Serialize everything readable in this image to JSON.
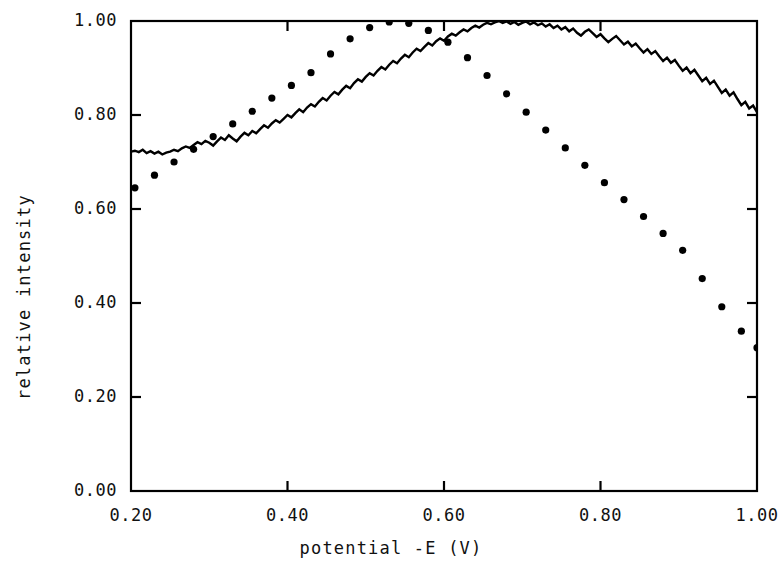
{
  "chart_data": {
    "type": "line",
    "title": "",
    "xlabel": "potential -E (V)",
    "ylabel": "relative intensity",
    "xlim": [
      0.2,
      1.0
    ],
    "ylim": [
      0.0,
      1.0
    ],
    "xticks": [
      "0.20",
      "0.40",
      "0.60",
      "0.80",
      "1.00"
    ],
    "yticks": [
      "0.00",
      "0.20",
      "0.40",
      "0.60",
      "0.80",
      "1.00"
    ],
    "xtick_values": [
      0.2,
      0.4,
      0.6,
      0.8,
      1.0
    ],
    "ytick_values": [
      0.0,
      0.2,
      0.4,
      0.6,
      0.8,
      1.0
    ],
    "grid": false,
    "legend": "none",
    "frame": "box",
    "tick_direction": "in",
    "series": [
      {
        "name": "measured",
        "style": "solid-noisy",
        "color": "#000000",
        "x": [
          0.2,
          0.205,
          0.21,
          0.215,
          0.22,
          0.225,
          0.23,
          0.235,
          0.24,
          0.245,
          0.25,
          0.255,
          0.26,
          0.265,
          0.27,
          0.275,
          0.28,
          0.285,
          0.29,
          0.295,
          0.3,
          0.305,
          0.31,
          0.315,
          0.32,
          0.325,
          0.33,
          0.335,
          0.34,
          0.345,
          0.35,
          0.355,
          0.36,
          0.365,
          0.37,
          0.375,
          0.38,
          0.385,
          0.39,
          0.395,
          0.4,
          0.405,
          0.41,
          0.415,
          0.42,
          0.425,
          0.43,
          0.435,
          0.44,
          0.445,
          0.45,
          0.455,
          0.46,
          0.465,
          0.47,
          0.475,
          0.48,
          0.485,
          0.49,
          0.495,
          0.5,
          0.505,
          0.51,
          0.515,
          0.52,
          0.525,
          0.53,
          0.535,
          0.54,
          0.545,
          0.55,
          0.555,
          0.56,
          0.565,
          0.57,
          0.575,
          0.58,
          0.585,
          0.59,
          0.595,
          0.6,
          0.605,
          0.61,
          0.615,
          0.62,
          0.625,
          0.63,
          0.635,
          0.64,
          0.645,
          0.65,
          0.655,
          0.66,
          0.665,
          0.67,
          0.675,
          0.68,
          0.685,
          0.69,
          0.695,
          0.7,
          0.705,
          0.71,
          0.715,
          0.72,
          0.725,
          0.73,
          0.735,
          0.74,
          0.745,
          0.75,
          0.755,
          0.76,
          0.765,
          0.77,
          0.775,
          0.78,
          0.785,
          0.79,
          0.795,
          0.8,
          0.805,
          0.81,
          0.815,
          0.82,
          0.825,
          0.83,
          0.835,
          0.84,
          0.845,
          0.85,
          0.855,
          0.86,
          0.865,
          0.87,
          0.875,
          0.88,
          0.885,
          0.89,
          0.895,
          0.9,
          0.905,
          0.91,
          0.915,
          0.92,
          0.925,
          0.93,
          0.935,
          0.94,
          0.945,
          0.95,
          0.955,
          0.96,
          0.965,
          0.97,
          0.975,
          0.98,
          0.985,
          0.99,
          0.995,
          1.0
        ],
        "y": [
          0.722,
          0.724,
          0.721,
          0.726,
          0.719,
          0.723,
          0.718,
          0.722,
          0.716,
          0.72,
          0.722,
          0.726,
          0.723,
          0.729,
          0.733,
          0.73,
          0.736,
          0.742,
          0.738,
          0.745,
          0.741,
          0.735,
          0.744,
          0.752,
          0.747,
          0.757,
          0.75,
          0.744,
          0.754,
          0.762,
          0.757,
          0.766,
          0.761,
          0.77,
          0.778,
          0.773,
          0.782,
          0.789,
          0.784,
          0.792,
          0.8,
          0.795,
          0.804,
          0.812,
          0.806,
          0.816,
          0.823,
          0.818,
          0.828,
          0.836,
          0.831,
          0.841,
          0.849,
          0.844,
          0.854,
          0.862,
          0.857,
          0.868,
          0.876,
          0.871,
          0.881,
          0.889,
          0.884,
          0.894,
          0.902,
          0.897,
          0.907,
          0.915,
          0.91,
          0.92,
          0.928,
          0.923,
          0.933,
          0.941,
          0.936,
          0.945,
          0.953,
          0.948,
          0.957,
          0.963,
          0.958,
          0.967,
          0.973,
          0.969,
          0.976,
          0.982,
          0.978,
          0.985,
          0.99,
          0.986,
          0.992,
          0.996,
          0.993,
          0.997,
          1.0,
          0.996,
          0.999,
          0.994,
          0.998,
          0.992,
          0.996,
          0.999,
          0.993,
          0.997,
          0.991,
          0.995,
          0.988,
          0.993,
          0.985,
          0.99,
          0.982,
          0.987,
          0.978,
          0.984,
          0.975,
          0.969,
          0.977,
          0.982,
          0.974,
          0.966,
          0.972,
          0.963,
          0.955,
          0.962,
          0.968,
          0.959,
          0.95,
          0.956,
          0.946,
          0.952,
          0.942,
          0.933,
          0.94,
          0.93,
          0.936,
          0.925,
          0.915,
          0.922,
          0.911,
          0.917,
          0.905,
          0.894,
          0.901,
          0.889,
          0.896,
          0.884,
          0.872,
          0.879,
          0.866,
          0.873,
          0.86,
          0.847,
          0.854,
          0.841,
          0.848,
          0.834,
          0.821,
          0.828,
          0.814,
          0.82,
          0.806
        ]
      },
      {
        "name": "calculated",
        "style": "dotted",
        "color": "#000000",
        "x": [
          0.205,
          0.23,
          0.255,
          0.28,
          0.305,
          0.33,
          0.355,
          0.38,
          0.405,
          0.43,
          0.455,
          0.48,
          0.505,
          0.53,
          0.555,
          0.58,
          0.605,
          0.63,
          0.655,
          0.68,
          0.705,
          0.73,
          0.755,
          0.78,
          0.805,
          0.83,
          0.855,
          0.88,
          0.905,
          0.93,
          0.955,
          0.98,
          1.0
        ],
        "y": [
          0.645,
          0.672,
          0.7,
          0.727,
          0.754,
          0.781,
          0.808,
          0.836,
          0.863,
          0.89,
          0.93,
          0.962,
          0.986,
          0.998,
          0.995,
          0.98,
          0.955,
          0.922,
          0.884,
          0.845,
          0.806,
          0.768,
          0.73,
          0.693,
          0.656,
          0.62,
          0.584,
          0.548,
          0.512,
          0.452,
          0.392,
          0.34,
          0.305
        ]
      }
    ],
    "annotations": []
  },
  "axes": {
    "left_px": 131,
    "right_px": 757,
    "top_px": 21,
    "bottom_px": 491
  }
}
